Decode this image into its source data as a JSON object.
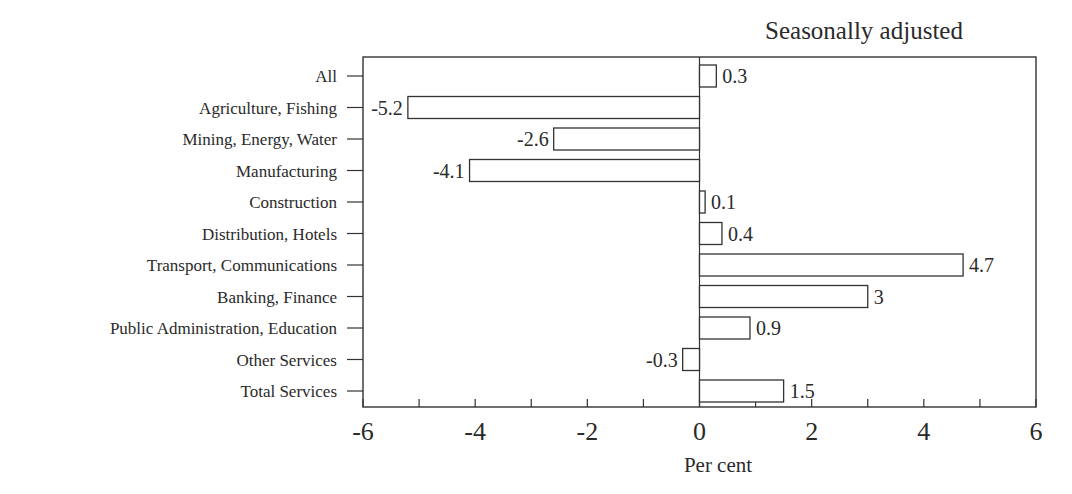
{
  "chart_data": {
    "type": "bar",
    "orientation": "horizontal",
    "title": "Seasonally adjusted",
    "xlabel": "Per cent",
    "ylabel": "",
    "xlim": [
      -6,
      6
    ],
    "xticks": [
      -6,
      -4,
      -2,
      0,
      2,
      4,
      6
    ],
    "minor_tick_step": 1,
    "grid": false,
    "legend": null,
    "categories": [
      "All",
      "Agriculture, Fishing",
      "Mining, Energy, Water",
      "Manufacturing",
      "Construction",
      "Distribution, Hotels",
      "Transport, Communications",
      "Banking, Finance",
      "Public Administration, Education",
      "Other Services",
      "Total Services"
    ],
    "values": [
      0.3,
      -5.2,
      -2.6,
      -4.1,
      0.1,
      0.4,
      4.7,
      3,
      0.9,
      -0.3,
      1.5
    ],
    "value_labels": [
      "0.3",
      "-5.2",
      "-2.6",
      "-4.1",
      "0.1",
      "0.4",
      "4.7",
      "3",
      "0.9",
      "-0.3",
      "1.5"
    ],
    "bar_fill": "#ffffff",
    "bar_stroke": "#333333"
  }
}
